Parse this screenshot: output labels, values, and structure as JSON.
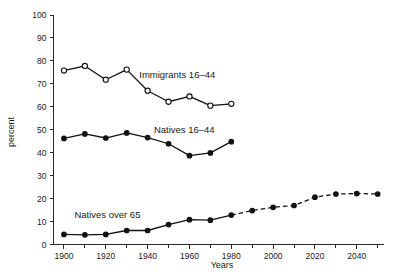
{
  "chart_data": {
    "type": "line",
    "title": "",
    "subtitle": "",
    "xlabel": "Years",
    "ylabel": "percent",
    "xlim": [
      1895,
      2053
    ],
    "ylim": [
      0,
      100
    ],
    "grid": false,
    "legend_position": "inline-annotations",
    "x_ticks_major": [
      1900,
      1920,
      1940,
      1960,
      1980,
      2000,
      2020,
      2040
    ],
    "x_ticks_minor": [
      1910,
      1930,
      1950,
      1970,
      1990,
      2010,
      2030,
      2050
    ],
    "y_ticks": [
      0,
      10,
      20,
      30,
      40,
      50,
      60,
      70,
      80,
      90,
      100
    ],
    "series": [
      {
        "name": "Immigrants 16–44",
        "marker": "open-circle",
        "linestyle": "solid",
        "x": [
          1900,
          1910,
          1920,
          1930,
          1940,
          1950,
          1960,
          1970,
          1980
        ],
        "values": [
          75.8,
          77.8,
          71.8,
          76.2,
          67.0,
          62.2,
          64.5,
          60.5,
          61.3
        ]
      },
      {
        "name": "Natives 16–44",
        "marker": "filled-circle",
        "linestyle": "solid",
        "x": [
          1900,
          1910,
          1920,
          1930,
          1940,
          1950,
          1960,
          1970,
          1980
        ],
        "values": [
          46.2,
          48.2,
          46.4,
          48.6,
          46.6,
          43.9,
          38.7,
          39.9,
          44.8
        ]
      },
      {
        "name": "Natives over 65",
        "marker": "filled-circle",
        "linestyle": "solid-then-dashed",
        "dash_starts_at": 1980,
        "x": [
          1900,
          1910,
          1920,
          1930,
          1940,
          1950,
          1960,
          1970,
          1980,
          1990,
          2000,
          2010,
          2020,
          2030,
          2040,
          2050
        ],
        "values": [
          4.4,
          4.2,
          4.4,
          6.1,
          6.1,
          8.7,
          10.8,
          10.6,
          12.8,
          14.8,
          16.2,
          17.0,
          20.6,
          22.0,
          22.2,
          22.0
        ]
      }
    ],
    "annotations": [
      {
        "text": "Immigrants 16–44",
        "x": 1936,
        "y": 72.5
      },
      {
        "text": "Natives 16–44",
        "x": 1943,
        "y": 48.5
      },
      {
        "text": "Natives over 65",
        "x": 1905,
        "y": 11.5
      }
    ]
  }
}
